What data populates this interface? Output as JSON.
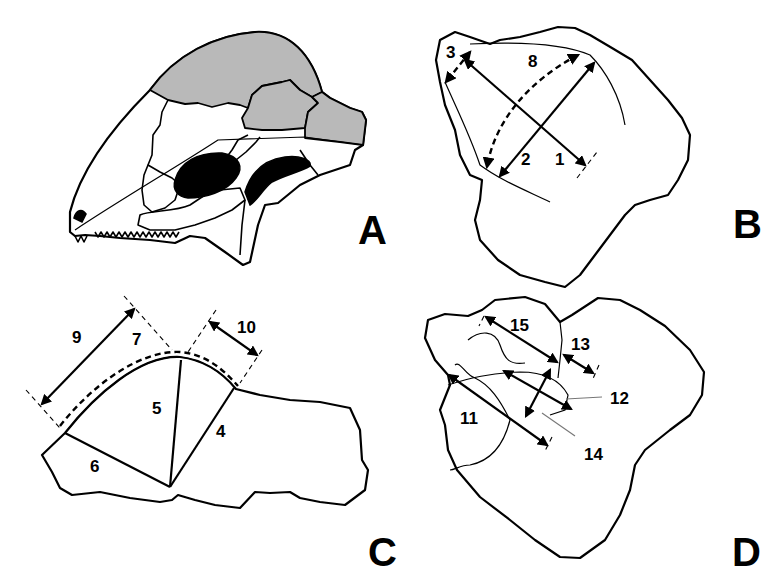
{
  "figure": {
    "panels": [
      {
        "id": "A",
        "label": "A",
        "description": "skull lateral view with shaded dorsal bones and black fenestrae"
      },
      {
        "id": "B",
        "label": "B",
        "description": "bone fragment with measurements 1, 2, 3, 8"
      },
      {
        "id": "C",
        "label": "C",
        "description": "bone fragment with measurements 4, 5, 6, 7, 9, 10"
      },
      {
        "id": "D",
        "label": "D",
        "description": "bone fragment with measurements 11, 12, 13, 14, 15"
      }
    ],
    "measurements": {
      "m1": "1",
      "m2": "2",
      "m3": "3",
      "m4": "4",
      "m5": "5",
      "m6": "6",
      "m7": "7",
      "m8": "8",
      "m9": "9",
      "m10": "10",
      "m11": "11",
      "m12": "12",
      "m13": "13",
      "m14": "14",
      "m15": "15"
    },
    "colors": {
      "line": "#000000",
      "shading": "#b9b9b9",
      "background": "#ffffff"
    }
  }
}
